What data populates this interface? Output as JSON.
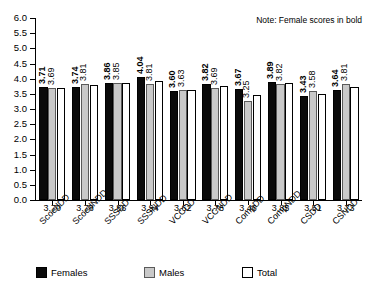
{
  "note": "Note: Female scores in bold",
  "legend": {
    "items": [
      {
        "label": "Females",
        "key": "females",
        "color": "#0a0a0a"
      },
      {
        "label": "Males",
        "key": "males",
        "color": "#c9c9c9"
      },
      {
        "label": "Total",
        "key": "total",
        "color": "#ffffff"
      }
    ]
  },
  "chart_data": {
    "type": "bar",
    "title": "",
    "xlabel": "",
    "ylabel": "",
    "ylim": [
      0.0,
      6.0
    ],
    "ytick_step": 0.5,
    "grid": false,
    "legend_position": "bottom",
    "categories": [
      "ScoedDD",
      "ScoedNDD",
      "SSSDD",
      "SSSNDD",
      "VCCDD",
      "VCCNDD",
      "CompDD",
      "CompNDD",
      "CSDD",
      "CSNDD"
    ],
    "ytick_labels": [
      "0.0",
      "0.5",
      "1.0",
      "1.5",
      "2.0",
      "2.5",
      "3.0",
      "3.5",
      "4.0",
      "4.5",
      "5.0",
      "5.5",
      "6.0"
    ],
    "series": [
      {
        "name": "Females",
        "values": [
          3.71,
          3.74,
          3.86,
          4.04,
          3.6,
          3.82,
          3.67,
          3.89,
          3.43,
          3.64
        ],
        "labels": [
          "3.71",
          "3.74",
          "3.86",
          "4.04",
          "3.60",
          "3.82",
          "3.67",
          "3.89",
          "3.43",
          "3.64"
        ]
      },
      {
        "name": "Males",
        "values": [
          3.69,
          3.81,
          3.85,
          3.81,
          3.63,
          3.69,
          3.25,
          3.82,
          3.58,
          3.81
        ],
        "labels": [
          "3.69",
          "3.81",
          "3.85",
          "3.81",
          "3.63",
          "3.69",
          "3.25",
          "3.82",
          "3.58",
          "3.81"
        ]
      },
      {
        "name": "Total",
        "values": [
          3.7,
          3.78,
          3.86,
          3.94,
          3.62,
          3.76,
          3.46,
          3.85,
          3.51,
          3.73
        ],
        "labels": [
          "3.70",
          "3.78",
          "3.86",
          "3.94",
          "3.62",
          "3.76",
          "3.46",
          "3.85",
          "3.51",
          "3.73"
        ]
      }
    ]
  }
}
